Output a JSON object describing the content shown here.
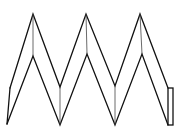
{
  "figure": {
    "stroke_color": "#111111",
    "background": "#ffffff",
    "outer_zigzag": [
      [
        10,
        88
      ],
      [
        33,
        14
      ],
      [
        60,
        87
      ],
      [
        86,
        14
      ],
      [
        115,
        86
      ],
      [
        140,
        14
      ],
      [
        168,
        88
      ]
    ],
    "inner_zigzag": [
      [
        7,
        124
      ],
      [
        33,
        56
      ],
      [
        60,
        125
      ],
      [
        87,
        54
      ],
      [
        115,
        125
      ],
      [
        142,
        54
      ],
      [
        168,
        125
      ]
    ],
    "fold_lines": [
      [
        [
          33,
          14
        ],
        [
          33,
          56
        ]
      ],
      [
        [
          60,
          87
        ],
        [
          60,
          125
        ]
      ],
      [
        [
          86,
          14
        ],
        [
          87,
          54
        ]
      ],
      [
        [
          115,
          86
        ],
        [
          115,
          125
        ]
      ],
      [
        [
          140,
          14
        ],
        [
          142,
          54
        ]
      ],
      [
        [
          10,
          88
        ],
        [
          7,
          124
        ]
      ]
    ],
    "end_tab": {
      "x": 168,
      "y": 88,
      "width": 5,
      "height": 37
    }
  }
}
